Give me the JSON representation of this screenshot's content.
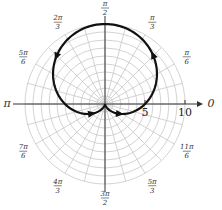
{
  "chart_data": {
    "type": "line",
    "subtype": "polar",
    "title": "",
    "equation": "r = 5(1 + sin θ)",
    "center_px": [
      105,
      104
    ],
    "px_per_unit": 8,
    "r_max": 10,
    "rings": [
      1,
      2,
      3,
      4,
      5,
      6,
      7,
      8,
      9,
      10
    ],
    "radial_tick_labels": [
      {
        "value": 5,
        "text": "5"
      },
      {
        "value": 10,
        "text": "10"
      }
    ],
    "angle_labels": [
      {
        "deg": 0,
        "num": "0",
        "den": ""
      },
      {
        "deg": 30,
        "num": "π",
        "den": "6"
      },
      {
        "deg": 60,
        "num": "π",
        "den": "3"
      },
      {
        "deg": 90,
        "num": "π",
        "den": "2"
      },
      {
        "deg": 120,
        "num": "2π",
        "den": "3"
      },
      {
        "deg": 150,
        "num": "5π",
        "den": "6"
      },
      {
        "deg": 180,
        "num": "π",
        "den": ""
      },
      {
        "deg": 210,
        "num": "7π",
        "den": "6"
      },
      {
        "deg": 240,
        "num": "4π",
        "den": "3"
      },
      {
        "deg": 270,
        "num": "3π",
        "den": "2"
      },
      {
        "deg": 300,
        "num": "5π",
        "den": "3"
      },
      {
        "deg": 330,
        "num": "11π",
        "den": "6"
      }
    ],
    "spokes_every_deg": 15,
    "curve_samples": {
      "theta_deg": [
        0,
        30,
        60,
        90,
        120,
        150,
        180,
        210,
        240,
        270,
        300,
        330,
        360
      ],
      "r": [
        5,
        7.5,
        9.33,
        10,
        9.33,
        7.5,
        5,
        2.5,
        0.67,
        0,
        0.67,
        2.5,
        5
      ]
    },
    "arrows_at_deg": [
      45,
      135,
      215,
      325
    ],
    "grid": true,
    "colors": {
      "grid": "#c8c8c8",
      "axis": "#333333",
      "curve": "#111111"
    }
  }
}
